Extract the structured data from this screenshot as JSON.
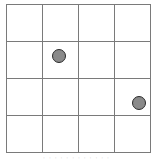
{
  "board": {
    "rows": 4,
    "cols": 4,
    "line_color": "#7a7a7a",
    "pieces": [
      {
        "row": 1,
        "col": 1,
        "color": "#8a8a8a"
      },
      {
        "row": 2,
        "col": 3,
        "color": "#8a8a8a"
      }
    ]
  },
  "caption": "· · · · · · · · · · · ·"
}
